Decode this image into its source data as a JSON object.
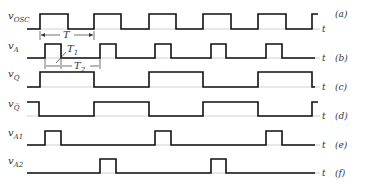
{
  "axis_label": "t",
  "signals": [
    {
      "id": "osc",
      "name": "v",
      "sub": "OSC",
      "tag": "(a)",
      "baseline": 29,
      "high": 14,
      "edges": [
        [
          40,
          68
        ],
        [
          94,
          121
        ],
        [
          149,
          176
        ],
        [
          203,
          231
        ],
        [
          258,
          286
        ],
        [
          312,
          315
        ]
      ]
    },
    {
      "id": "a",
      "name": "v",
      "sub": "A",
      "tag": "(b)",
      "baseline": 58,
      "high": 44,
      "edges": [
        [
          45,
          61
        ],
        [
          100,
          116
        ],
        [
          155,
          171
        ],
        [
          211,
          226
        ],
        [
          266,
          282
        ]
      ]
    },
    {
      "id": "q",
      "name": "v",
      "sub": "Q",
      "tag": "(c)",
      "baseline": 87,
      "high": 72,
      "edges": [
        [
          40,
          94
        ],
        [
          149,
          203
        ],
        [
          258,
          312
        ]
      ]
    },
    {
      "id": "qbar",
      "name": "v",
      "sub": "Q̅",
      "tag": "(d)",
      "baseline": 116,
      "high": 102,
      "edges": [
        [
          27,
          39
        ],
        [
          94,
          149
        ],
        [
          203,
          258
        ],
        [
          312,
          315
        ]
      ]
    },
    {
      "id": "a1",
      "name": "v",
      "sub": "A1",
      "tag": "(e)",
      "baseline": 145,
      "high": 131,
      "edges": [
        [
          45,
          61
        ],
        [
          155,
          171
        ],
        [
          266,
          282
        ]
      ]
    },
    {
      "id": "a2",
      "name": "v",
      "sub": "A2",
      "tag": "(f)",
      "baseline": 173,
      "high": 159,
      "edges": [
        [
          100,
          116
        ],
        [
          211,
          226
        ]
      ]
    }
  ],
  "annotations": {
    "T": "T",
    "T1": "T",
    "T1_sub": "1",
    "T2": "T",
    "T2_sub": "2"
  },
  "x_start": 27,
  "x_end": 315
}
